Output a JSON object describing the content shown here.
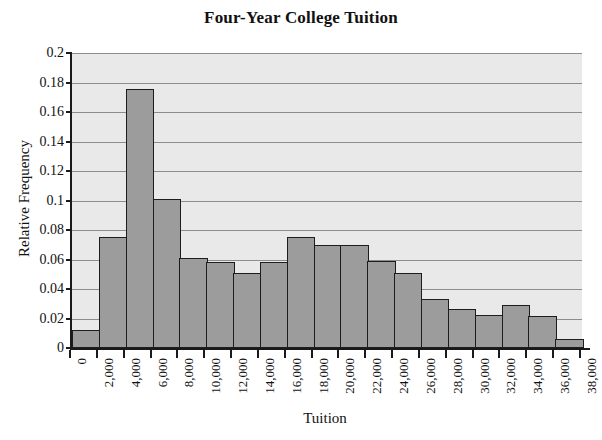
{
  "chart_data": {
    "type": "bar",
    "title": "Four-Year College Tuition",
    "xlabel": "Tuition",
    "ylabel": "Relative Frequency",
    "ylim": [
      0,
      0.2
    ],
    "ytick_labels": [
      "0",
      "0.02",
      "0.04",
      "0.06",
      "0.08",
      "0.1",
      "0.12",
      "0.14",
      "0.16",
      "0.18",
      "0.2"
    ],
    "ytick_values": [
      0,
      0.02,
      0.04,
      0.06,
      0.08,
      0.1,
      0.12,
      0.14,
      0.16,
      0.18,
      0.2
    ],
    "xtick_labels": [
      "0",
      "2,000",
      "4,000",
      "6,000",
      "8,000",
      "10,000",
      "12,000",
      "14,000",
      "16,000",
      "18,000",
      "20,000",
      "22,000",
      "24,000",
      "26,000",
      "28,000",
      "30,000",
      "32,000",
      "34,000",
      "36,000",
      "38,000"
    ],
    "xtick_values": [
      0,
      2000,
      4000,
      6000,
      8000,
      10000,
      12000,
      14000,
      16000,
      18000,
      20000,
      22000,
      24000,
      26000,
      28000,
      30000,
      32000,
      34000,
      36000,
      38000
    ],
    "bin_edges": [
      0,
      2000,
      4000,
      6000,
      8000,
      10000,
      12000,
      14000,
      16000,
      18000,
      20000,
      22000,
      24000,
      26000,
      28000,
      30000,
      32000,
      34000,
      36000,
      38000
    ],
    "categories": [
      "0-2,000",
      "2,000-4,000",
      "4,000-6,000",
      "6,000-8,000",
      "8,000-10,000",
      "10,000-12,000",
      "12,000-14,000",
      "14,000-16,000",
      "16,000-18,000",
      "18,000-20,000",
      "20,000-22,000",
      "22,000-24,000",
      "24,000-26,000",
      "26,000-28,000",
      "28,000-30,000",
      "30,000-32,000",
      "32,000-34,000",
      "34,000-36,000",
      "36,000-38,000"
    ],
    "values": [
      0.0125,
      0.075,
      0.1755,
      0.101,
      0.061,
      0.058,
      0.051,
      0.058,
      0.075,
      0.07,
      0.07,
      0.059,
      0.051,
      0.0335,
      0.0265,
      0.0225,
      0.0295,
      0.0215,
      0.006
    ],
    "grid": true,
    "grid_axis": "y",
    "legend": false,
    "legend_position": "none",
    "colors": {
      "bar_fill": "#9c9c9c",
      "bar_edge": "#1d1d1d",
      "plot_background": "#e9e9e9",
      "gridline": "#8d8d8d",
      "axis": "#1a1a1a",
      "text": "#111111",
      "page_background": "#ffffff"
    }
  }
}
